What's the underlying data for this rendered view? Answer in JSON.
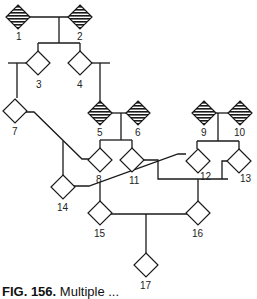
{
  "diagram": {
    "type": "pedigree",
    "colors": {
      "line": "#1a1a1a",
      "affected_hatch": "#1a1a1a",
      "background": "#ffffff"
    },
    "individuals": [
      {
        "id": "1",
        "label": "1",
        "affected": true
      },
      {
        "id": "2",
        "label": "2",
        "affected": true
      },
      {
        "id": "3",
        "label": "3",
        "affected": false
      },
      {
        "id": "4",
        "label": "4",
        "affected": false
      },
      {
        "id": "5",
        "label": "5",
        "affected": true
      },
      {
        "id": "6",
        "label": "6",
        "affected": true
      },
      {
        "id": "7",
        "label": "7",
        "affected": false
      },
      {
        "id": "8",
        "label": "8",
        "affected": false
      },
      {
        "id": "9",
        "label": "9",
        "affected": true
      },
      {
        "id": "10",
        "label": "10",
        "affected": true
      },
      {
        "id": "11",
        "label": "11",
        "affected": false
      },
      {
        "id": "12",
        "label": "12",
        "affected": false
      },
      {
        "id": "13",
        "label": "13",
        "affected": false
      },
      {
        "id": "14",
        "label": "14",
        "affected": false
      },
      {
        "id": "15",
        "label": "15",
        "affected": false
      },
      {
        "id": "16",
        "label": "16",
        "affected": false
      },
      {
        "id": "17",
        "label": "17",
        "affected": false
      }
    ],
    "matings": [
      {
        "parents": [
          "1",
          "2"
        ],
        "children": [
          "3",
          "4"
        ]
      },
      {
        "parents": [
          "5",
          "6"
        ],
        "children": [
          "8",
          "11"
        ]
      },
      {
        "parents": [
          "9",
          "10"
        ],
        "children": [
          "12",
          "13"
        ]
      },
      {
        "parents": [
          "7",
          "8"
        ],
        "children": [
          "14"
        ]
      },
      {
        "parents": [
          "14",
          "12"
        ],
        "children": [
          "15"
        ]
      },
      {
        "parents": [
          "11",
          "13"
        ],
        "children": [
          "16"
        ]
      },
      {
        "parents": [
          "15",
          "16"
        ],
        "children": [
          "17"
        ]
      }
    ]
  },
  "caption": {
    "prefix": "FIG. 156.",
    "text": "Multiple ..."
  }
}
